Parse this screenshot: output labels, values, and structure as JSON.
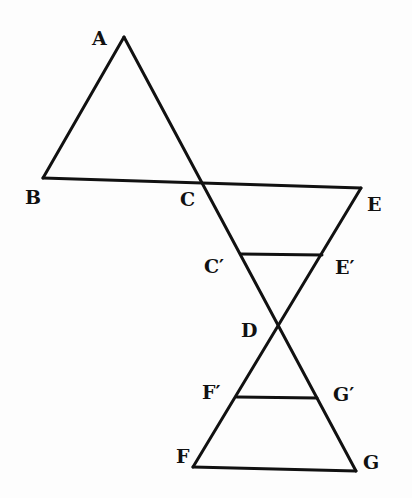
{
  "diagram": {
    "points": {
      "A": {
        "label": "A",
        "x": 124,
        "y": 37
      },
      "B": {
        "label": "B",
        "x": 43,
        "y": 178
      },
      "C": {
        "label": "C",
        "x": 201,
        "y": 182
      },
      "E": {
        "label": "E",
        "x": 361,
        "y": 188
      },
      "C_prime": {
        "label": "C′",
        "x": 241,
        "y": 254
      },
      "E_prime": {
        "label": "E′",
        "x": 322,
        "y": 255
      },
      "D": {
        "label": "D",
        "x": 278,
        "y": 328
      },
      "F_prime": {
        "label": "F′",
        "x": 237,
        "y": 397
      },
      "G_prime": {
        "label": "G′",
        "x": 317,
        "y": 398
      },
      "F": {
        "label": "F",
        "x": 193,
        "y": 467
      },
      "G": {
        "label": "G",
        "x": 356,
        "y": 471
      }
    },
    "segments": [
      [
        "A",
        "B"
      ],
      [
        "A",
        "G"
      ],
      [
        "B",
        "E"
      ],
      [
        "E",
        "F"
      ],
      [
        "C_prime",
        "E_prime"
      ],
      [
        "F_prime",
        "G_prime"
      ],
      [
        "F",
        "G"
      ]
    ],
    "labels": {
      "A": "A",
      "B": "B",
      "C": "C",
      "E": "E",
      "C_prime": "C′",
      "E_prime": "E′",
      "D": "D",
      "F_prime": "F′",
      "G_prime": "G′",
      "F": "F",
      "G": "G"
    }
  }
}
